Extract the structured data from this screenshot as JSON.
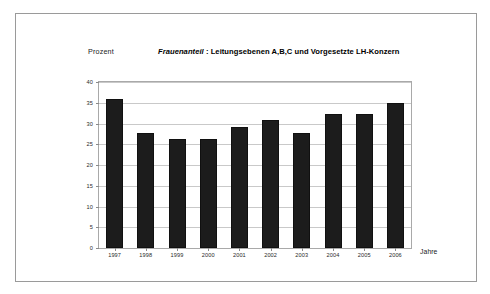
{
  "chart_data": {
    "type": "bar",
    "title": "Frauenanteil :  Leitungsebenen A,B,C und  Vorgesetzte LH-Konzern",
    "title_parts": {
      "emphasis": "Frauenanteil",
      "separator": " :  ",
      "rest": "Leitungsebenen A,B,C und  Vorgesetzte LH-Konzern"
    },
    "subtitle": "",
    "xlabel": "Jahre",
    "ylabel": "Prozent",
    "categories": [
      "1997",
      "1998",
      "1999",
      "2000",
      "2001",
      "2002",
      "2003",
      "2004",
      "2005",
      "2006"
    ],
    "values": [
      36,
      27.8,
      26.2,
      26.2,
      29.2,
      30.8,
      27.8,
      32.2,
      32.4,
      35
    ],
    "ylim": [
      0,
      40
    ],
    "ytick_labels": [
      "0",
      "5",
      "10",
      "15",
      "20",
      "25",
      "30",
      "35",
      "40"
    ],
    "ytick_values": [
      0,
      5,
      10,
      15,
      20,
      25,
      30,
      35,
      40
    ],
    "grid": true,
    "grid_axis": "y",
    "legend": false,
    "legend_position": "none",
    "bar_color": "#1c1c1c",
    "grid_color": "#c9c9c9",
    "axis_color": "#a9a9a9",
    "background_color": "#ffffff",
    "series": [
      {
        "name": "Frauenanteil",
        "values": [
          36,
          27.8,
          26.2,
          26.2,
          29.2,
          30.8,
          27.8,
          32.2,
          32.4,
          35
        ]
      }
    ]
  },
  "frame": {
    "border_color": "#9a9a9a"
  }
}
